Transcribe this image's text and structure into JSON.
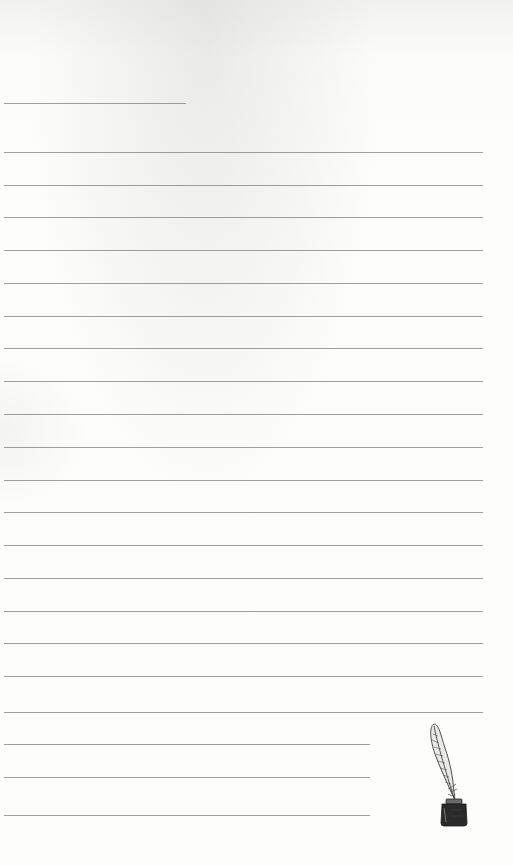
{
  "page": {
    "type": "lined-stationery",
    "background_color": "#fbfbfa",
    "rule_color": "#8d8d8d"
  },
  "rules": [
    {
      "y": 103,
      "x_end": 186,
      "kind": "header-short"
    },
    {
      "y": 152,
      "x_end": 483,
      "kind": "full"
    },
    {
      "y": 185,
      "x_end": 483,
      "kind": "full"
    },
    {
      "y": 217,
      "x_end": 483,
      "kind": "full"
    },
    {
      "y": 250,
      "x_end": 483,
      "kind": "full"
    },
    {
      "y": 283,
      "x_end": 483,
      "kind": "full"
    },
    {
      "y": 316,
      "x_end": 483,
      "kind": "full"
    },
    {
      "y": 348,
      "x_end": 483,
      "kind": "full"
    },
    {
      "y": 381,
      "x_end": 483,
      "kind": "full"
    },
    {
      "y": 414,
      "x_end": 483,
      "kind": "full"
    },
    {
      "y": 447,
      "x_end": 483,
      "kind": "full"
    },
    {
      "y": 480,
      "x_end": 483,
      "kind": "full"
    },
    {
      "y": 512,
      "x_end": 483,
      "kind": "full"
    },
    {
      "y": 545,
      "x_end": 483,
      "kind": "full"
    },
    {
      "y": 578,
      "x_end": 483,
      "kind": "full"
    },
    {
      "y": 611,
      "x_end": 483,
      "kind": "full"
    },
    {
      "y": 643,
      "x_end": 483,
      "kind": "full"
    },
    {
      "y": 676,
      "x_end": 483,
      "kind": "full"
    },
    {
      "y": 712,
      "x_end": 483,
      "kind": "full"
    },
    {
      "y": 744,
      "x_end": 370,
      "kind": "short"
    },
    {
      "y": 777,
      "x_end": 370,
      "kind": "short"
    },
    {
      "y": 815,
      "x_end": 370,
      "kind": "short"
    }
  ],
  "decoration": {
    "icon": "quill-and-inkwell-icon",
    "position": "bottom-right"
  }
}
